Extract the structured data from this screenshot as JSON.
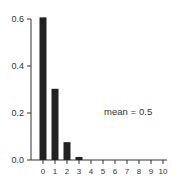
{
  "chart_data": {
    "type": "bar",
    "title": "",
    "xlabel": "",
    "ylabel": "",
    "categories": [
      "0",
      "1",
      "2",
      "3",
      "4",
      "5",
      "6",
      "7",
      "8",
      "9",
      "10"
    ],
    "values": [
      0.607,
      0.303,
      0.076,
      0.013,
      0.002,
      0.0,
      0.0,
      0.0,
      0.0,
      0.0,
      0.0
    ],
    "ylim": [
      0,
      0.6
    ],
    "yticks": [
      "0.0",
      "0.2",
      "0.4",
      "0.6"
    ],
    "xticks": [
      "0",
      "1",
      "2",
      "3",
      "4",
      "5",
      "6",
      "7",
      "8",
      "9",
      "10"
    ],
    "grid": false,
    "annotation": {
      "label": "mean =",
      "value": "0.5"
    },
    "bar_color": "#222222"
  }
}
